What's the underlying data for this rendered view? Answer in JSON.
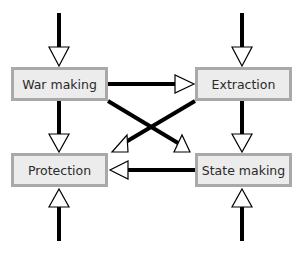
{
  "diagram": {
    "type": "flow",
    "nodes": [
      {
        "id": "war_making",
        "label": "War making"
      },
      {
        "id": "extraction",
        "label": "Extraction"
      },
      {
        "id": "protection",
        "label": "Protection"
      },
      {
        "id": "state_making",
        "label": "State making"
      }
    ],
    "edges": [
      {
        "from": "external_top_left",
        "to": "war_making"
      },
      {
        "from": "external_top_right",
        "to": "extraction"
      },
      {
        "from": "external_bottom_left",
        "to": "protection"
      },
      {
        "from": "external_bottom_right",
        "to": "state_making"
      },
      {
        "from": "war_making",
        "to": "extraction"
      },
      {
        "from": "war_making",
        "to": "protection"
      },
      {
        "from": "war_making",
        "to": "state_making"
      },
      {
        "from": "extraction",
        "to": "protection"
      },
      {
        "from": "extraction",
        "to": "state_making"
      },
      {
        "from": "state_making",
        "to": "protection"
      }
    ],
    "colors": {
      "box_fill": "#ececec",
      "box_border": "#a9a9a9",
      "line": "#000000",
      "arrowhead_fill": "#ffffff"
    }
  }
}
